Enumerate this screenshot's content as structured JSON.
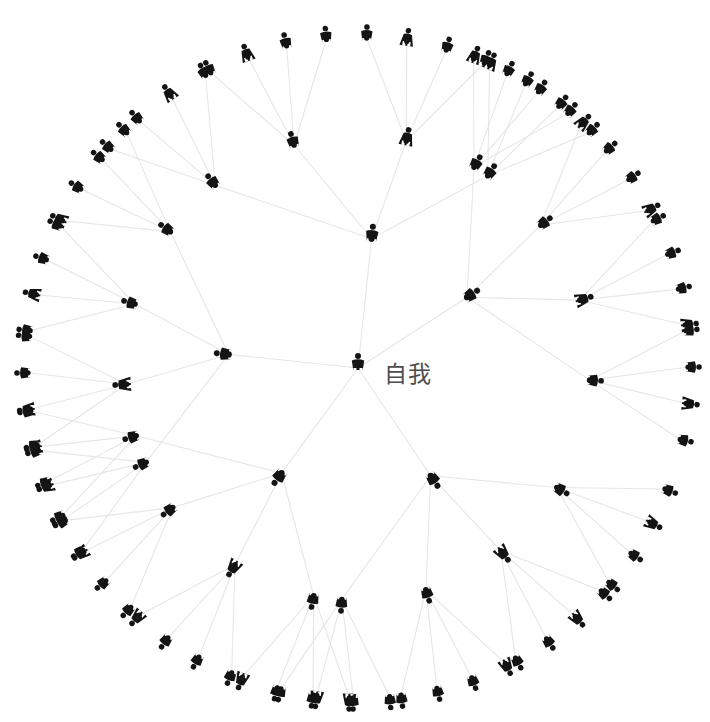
{
  "graph": {
    "title": "自我 social network radial tree",
    "center_label": "自我",
    "center_label_x": 384,
    "center_label_y": 355,
    "center_label_size": 23,
    "center": {
      "x": 358,
      "y": 368
    },
    "colors": {
      "background": "#ffffff",
      "figure": "#141414",
      "node_dot": "#111111",
      "edge": "#e6e6e6",
      "label_text": "#4d4d4d"
    },
    "edge_width": 1.1,
    "levels": [
      {
        "level": 0,
        "name": "self",
        "radius": 0,
        "figure_scale": 1.0,
        "dot_r": 0
      },
      {
        "level": 1,
        "name": "close-circle",
        "radius": 130,
        "figure_scale": 1.0,
        "dot_r": 3.1
      },
      {
        "level": 2,
        "name": "extended-tie",
        "radius": 232,
        "figure_scale": 0.95,
        "dot_r": 2.8
      },
      {
        "level": 3,
        "name": "weak-tie",
        "radius": 330,
        "figure_scale": 0.92,
        "dot_r": 2.6
      }
    ],
    "branches": [
      {
        "id": "b1",
        "angle": -84,
        "children_angles": [
          -128,
          -106,
          -78,
          -56
        ],
        "leaf_spread": 21,
        "leaves_per_child": 4,
        "genders": [
          "m"
        ]
      },
      {
        "id": "b2",
        "angle": -33,
        "children_angles": [
          -60,
          -38,
          -17,
          3
        ],
        "leaf_spread": 19,
        "leaves_per_child": 4,
        "genders": [
          "m"
        ]
      },
      {
        "id": "b3",
        "angle": 186,
        "children_angles": [
          156,
          176,
          196,
          216
        ],
        "leaf_spread": 19,
        "leaves_per_child": 4,
        "genders": [
          "m"
        ]
      },
      {
        "id": "b4",
        "angle": 126,
        "children_angles": [
          101,
          122,
          143,
          163
        ],
        "leaf_spread": 19,
        "leaves_per_child": 4,
        "genders": [
          "m"
        ]
      },
      {
        "id": "b5",
        "angle": 56,
        "children_angles": [
          31,
          52,
          73,
          94
        ],
        "leaf_spread": 19,
        "leaves_per_child": 4,
        "genders": [
          "m"
        ]
      }
    ],
    "gender_pattern_level3": "mmfmmfmmmfmmfmmmfmmmfmmfmmmfmmfmmmfmmfmmmfmmfmmmfmmfmmmfmmfmmmfmmfmmmfmmfmmm",
    "gender_pattern_level2": "mmfmmmfmmfmmmfmmmfmm",
    "gender_pattern_level1": "mmmmm",
    "counts": {
      "level1_nodes": 5,
      "level2_nodes": 20,
      "level3_nodes": 80,
      "total_figures": 106
    },
    "figure_geometry": {
      "description": "ISO-style pictogram person, head circle plus body",
      "head_r": 3.0,
      "head_cy": -12.0,
      "body_height": 22,
      "shoulder_half_width": 6.2,
      "hip_half_width": 4.6,
      "leg_gap": 1.5,
      "skirt_half_width": 7.4
    }
  }
}
